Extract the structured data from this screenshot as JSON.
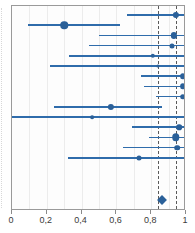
{
  "figure": {
    "title": "",
    "width": 195,
    "height": 233,
    "background": "#ffffff",
    "frame_color": "#9a9a9a"
  },
  "colors": {
    "marker": "#2a6099",
    "line": "#2f6cab",
    "gridline": "#ececec",
    "refline": "#5a5a5a",
    "axis_text": "#3a3a3a"
  },
  "axis": {
    "label": "",
    "min": 0,
    "max": 1,
    "tick_values": [
      0,
      0.2,
      0.4,
      0.6,
      0.8,
      1
    ],
    "tick_labels": [
      "0",
      "0,2",
      "0,4",
      "0,6",
      "0,8",
      "1"
    ],
    "minor_gridlines": [
      0.1,
      0.2,
      0.3,
      0.4,
      0.5,
      0.6,
      0.7,
      0.8,
      0.9
    ]
  },
  "reference_lines": [
    {
      "name": "summary-refline",
      "value": 0.84,
      "style": "dashed"
    },
    {
      "name": "null-refline",
      "value": 0.94,
      "style": "dashed"
    }
  ],
  "chart_data": {
    "type": "scatter",
    "subtype": "forest-plot",
    "title": "",
    "xlabel": "",
    "ylabel": "",
    "xlim": [
      0,
      1
    ],
    "grid": true,
    "legend": "none",
    "x_tick_labels": [
      "0",
      "0,2",
      "0,4",
      "0,6",
      "0,8",
      "1"
    ],
    "reference_values": [
      0.84,
      0.94
    ],
    "rows": [
      {
        "label": "",
        "estimate": 0.94,
        "ci_low": 0.66,
        "ci_high": 1.0,
        "weight": 5,
        "clipped_high": true
      },
      {
        "label": "",
        "estimate": 0.3,
        "ci_low": 0.09,
        "ci_high": 0.62,
        "weight": 6,
        "clipped_high": false
      },
      {
        "label": "",
        "estimate": 0.93,
        "ci_low": 0.5,
        "ci_high": 1.0,
        "weight": 5,
        "clipped_high": true
      },
      {
        "label": "",
        "estimate": 0.92,
        "ci_low": 0.44,
        "ci_high": 1.0,
        "weight": 4,
        "clipped_high": true
      },
      {
        "label": "",
        "estimate": 0.81,
        "ci_low": 0.33,
        "ci_high": 1.0,
        "weight": 3.5,
        "clipped_high": true
      },
      {
        "label": "",
        "estimate": 0.84,
        "ci_low": 0.22,
        "ci_high": 1.0,
        "weight": 2.5,
        "clipped_high": true
      },
      {
        "label": "",
        "estimate": 0.98,
        "ci_low": 0.74,
        "ci_high": 1.0,
        "weight": 4.5,
        "clipped_high": true
      },
      {
        "label": "",
        "estimate": 0.98,
        "ci_low": 0.76,
        "ci_high": 1.0,
        "weight": 4.5,
        "clipped_high": true
      },
      {
        "label": "",
        "estimate": 0.98,
        "ci_low": 0.83,
        "ci_high": 1.0,
        "weight": 4.5,
        "clipped_high": true
      },
      {
        "label": "",
        "estimate": 0.57,
        "ci_low": 0.24,
        "ci_high": 0.86,
        "weight": 5,
        "clipped_high": false
      },
      {
        "label": "",
        "estimate": 0.46,
        "ci_low": 0.0,
        "ci_high": 1.0,
        "weight": 3,
        "clipped_high": true
      },
      {
        "label": "",
        "estimate": 0.96,
        "ci_low": 0.69,
        "ci_high": 1.0,
        "weight": 4.5,
        "clipped_high": true
      },
      {
        "label": "",
        "estimate": 0.94,
        "ci_low": 0.79,
        "ci_high": 1.0,
        "weight": 6,
        "clipped_high": true
      },
      {
        "label": "",
        "estimate": 0.95,
        "ci_low": 0.64,
        "ci_high": 1.0,
        "weight": 4.5,
        "clipped_high": true
      },
      {
        "label": "",
        "estimate": 0.73,
        "ci_low": 0.32,
        "ci_high": 1.0,
        "weight": 4,
        "clipped_high": true
      }
    ],
    "summary": {
      "label": "",
      "estimate": 0.86,
      "ci_low": 0.81,
      "ci_high": 0.91,
      "shape": "diamond"
    }
  }
}
